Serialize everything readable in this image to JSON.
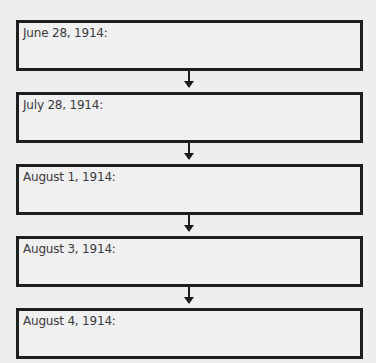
{
  "timeline": {
    "boxes": [
      {
        "label": "June 28, 1914:",
        "value": ""
      },
      {
        "label": "July 28, 1914:",
        "value": ""
      },
      {
        "label": "August 1, 1914:",
        "value": ""
      },
      {
        "label": "August 3, 1914:",
        "value": ""
      },
      {
        "label": "August 4, 1914:",
        "value": ""
      }
    ],
    "colors": {
      "border": "#1e1e1e",
      "text": "#3a3a3a",
      "background": "#eeeeee"
    }
  }
}
